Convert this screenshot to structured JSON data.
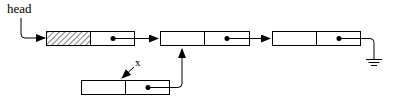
{
  "diagram": {
    "type": "linked-list",
    "head_label": "head",
    "pointer_label": "x",
    "nodes": [
      {
        "id": "node-1",
        "data": "",
        "data_hatched": true,
        "next": "node-2"
      },
      {
        "id": "node-2",
        "data": "",
        "data_hatched": false,
        "next": "node-3"
      },
      {
        "id": "node-3",
        "data": "",
        "data_hatched": false,
        "next": "null"
      },
      {
        "id": "node-x",
        "data": "",
        "data_hatched": false,
        "next": "node-2"
      }
    ],
    "null_symbol": "ground",
    "colors": {
      "stroke": "#000000",
      "background": "#ffffff"
    }
  }
}
